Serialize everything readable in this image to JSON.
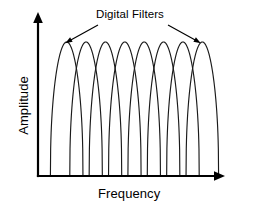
{
  "figure": {
    "title": "",
    "annotation_label": "Digital Filters",
    "background_color": "#ffffff",
    "line_color": "#1a1a1a",
    "axis_color": "#000000"
  },
  "axes": {
    "x_label": "Frequency",
    "y_label": "Amplitude",
    "x_ticks": [],
    "y_ticks": [],
    "grid": false,
    "x_origin_px": 38,
    "y_origin_px": 176
  },
  "annotations": [
    {
      "text": "Digital Filters",
      "leader_from": [
        98,
        26
      ],
      "leader_to": [
        67,
        43
      ],
      "target_curve_index": 0
    },
    {
      "text": "Digital Filters",
      "leader_from": [
        168,
        26
      ],
      "leader_to": [
        199,
        43
      ],
      "target_curve_index": 7
    }
  ],
  "chart_data": {
    "type": "line",
    "title": "Digital Filters",
    "xlabel": "Frequency",
    "ylabel": "Amplitude",
    "grid": false,
    "legend": "none",
    "xlim": [
      0,
      1
    ],
    "ylim": [
      0,
      1
    ],
    "x_tick_labels": [],
    "y_tick_labels": [],
    "n_filters": 8,
    "peak_amplitude": 1.0,
    "filter_centers": [
      0.0625,
      0.1875,
      0.3125,
      0.4375,
      0.5625,
      0.6875,
      0.8125,
      0.9375
    ],
    "series": [
      {
        "name": "Filter 1",
        "center": 0.0625,
        "peak": 1.0,
        "half_width": 0.105
      },
      {
        "name": "Filter 2",
        "center": 0.1875,
        "peak": 1.0,
        "half_width": 0.105
      },
      {
        "name": "Filter 3",
        "center": 0.3125,
        "peak": 1.0,
        "half_width": 0.105
      },
      {
        "name": "Filter 4",
        "center": 0.4375,
        "peak": 1.0,
        "half_width": 0.105
      },
      {
        "name": "Filter 5",
        "center": 0.5625,
        "peak": 1.0,
        "half_width": 0.105
      },
      {
        "name": "Filter 6",
        "center": 0.6875,
        "peak": 1.0,
        "half_width": 0.105
      },
      {
        "name": "Filter 7",
        "center": 0.8125,
        "peak": 1.0,
        "half_width": 0.105
      },
      {
        "name": "Filter 8",
        "center": 0.9375,
        "peak": 1.0,
        "half_width": 0.105
      }
    ]
  }
}
